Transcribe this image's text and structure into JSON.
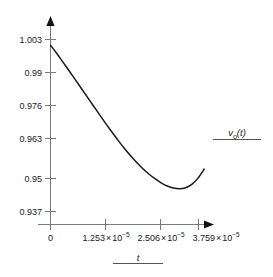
{
  "chart_data": {
    "type": "line",
    "title": "",
    "xlabel": "t",
    "ylabel": "",
    "legend": {
      "position": "right",
      "entries": [
        "vo(t)"
      ]
    },
    "grid": false,
    "axis_style": "arrow-terminated",
    "xlim": [
      0,
      4.385e-05
    ],
    "ylim": [
      0.9305,
      1.0095
    ],
    "xticks": [
      0,
      1.253e-05,
      2.506e-05,
      3.759e-05
    ],
    "xtick_labels": [
      "0",
      "1.253 × 10−5",
      "2.506 × 10−5",
      "3.759 × 10−5"
    ],
    "yticks": [
      0.937,
      0.95,
      0.963,
      0.976,
      0.99,
      1.003
    ],
    "ytick_labels": [
      "0.937",
      "0.95",
      "0.963",
      "0.976",
      "0.99",
      "1.003"
    ],
    "series": [
      {
        "name": "vo(t)",
        "color": "#1a1a1a",
        "x": [
          0,
          1.4e-06,
          2.8e-06,
          4.2e-06,
          5.6e-06,
          7e-06,
          8.4e-06,
          9.8e-06,
          1.12e-05,
          1.26e-05,
          1.4e-05,
          1.54e-05,
          1.68e-05,
          1.82e-05,
          1.96e-05,
          2.1e-05,
          2.24e-05,
          2.38e-05,
          2.52e-05,
          2.66e-05,
          2.8e-05,
          2.94e-05,
          3.08e-05,
          3.22e-05,
          3.36e-05,
          3.5e-05
        ],
        "y": [
          1.0008,
          0.9977,
          0.9944,
          0.9911,
          0.9877,
          0.9843,
          0.9809,
          0.9775,
          0.9741,
          0.9707,
          0.9675,
          0.9643,
          0.9613,
          0.9585,
          0.9559,
          0.9535,
          0.9514,
          0.9496,
          0.948,
          0.9468,
          0.946,
          0.9457,
          0.9461,
          0.9474,
          0.9498,
          0.9533
        ]
      }
    ]
  },
  "axes": {
    "x_title": "t",
    "y_title": ""
  }
}
